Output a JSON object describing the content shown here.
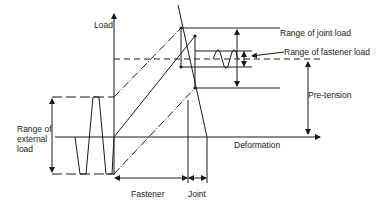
{
  "diagram": {
    "type": "bolted-joint-load-deformation",
    "axes": {
      "y_label": "Load",
      "x_label": "Deformation"
    },
    "labels": {
      "range_joint_load": "Range of joint load",
      "range_fastener_load": "Range of fastener load",
      "pre_tension": "Pre-tension",
      "range_external_load_line1": "Range of",
      "range_external_load_line2": "external",
      "range_external_load_line3": "load",
      "fastener": "Fastener",
      "joint": "Joint"
    },
    "colors": {
      "line": "#1a1a1a",
      "background": "#ffffff"
    }
  }
}
